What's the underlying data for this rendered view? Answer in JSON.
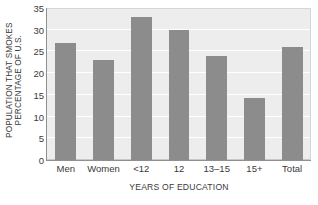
{
  "chart_data": {
    "type": "bar",
    "title": "",
    "subtitle": "",
    "xlabel": "YEARS OF EDUCATION",
    "ylabel_lines": [
      "PERCENTAGE OF U.S.",
      "POPULATION THAT SMOKES"
    ],
    "ylabel": "PERCENTAGE OF U.S. POPULATION THAT SMOKES",
    "categories": [
      "Men",
      "Women",
      "<12",
      "12",
      "13–15",
      "15+",
      "Total"
    ],
    "values": [
      27,
      23,
      33,
      30,
      24,
      14.2,
      26
    ],
    "ylim": [
      0,
      35
    ],
    "yticks": [
      0,
      5,
      10,
      15,
      20,
      25,
      30,
      35
    ],
    "ytick_labels": [
      "0",
      "5",
      "10",
      "15",
      "20",
      "25",
      "30",
      "35"
    ],
    "grid": true,
    "grid_axis": "y",
    "legend": false,
    "legend_position": "none",
    "bar_color": "#8c8c8c",
    "plot_background": "#ededed",
    "gridline_color": "#ffffff",
    "axis_color": "#8f8f8f",
    "text_color": "#3a3a3a",
    "figure_background": "#ffffff"
  }
}
